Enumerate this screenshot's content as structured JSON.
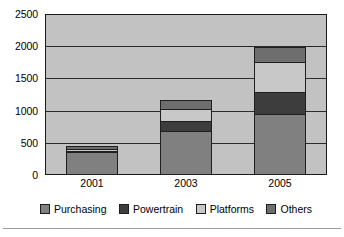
{
  "chart_data": {
    "type": "bar",
    "subtype": "stacked-bar",
    "title": "",
    "xlabel": "",
    "ylabel": "",
    "categories": [
      "2001",
      "2003",
      "2005"
    ],
    "ylim": [
      0,
      2500
    ],
    "yticks": [
      0,
      500,
      1000,
      1500,
      2000,
      2500
    ],
    "ytick_labels": [
      "0",
      "500",
      "1000",
      "1500",
      "2000",
      "2500"
    ],
    "grid": true,
    "grid_axis": "y",
    "legend_position": "bottom",
    "series": [
      {
        "name": "Purchasing",
        "color": "#808080",
        "values": [
          350,
          680,
          950
        ]
      },
      {
        "name": "Powertrain",
        "color": "#3d3d3d",
        "values": [
          40,
          170,
          360
        ]
      },
      {
        "name": "Platforms",
        "color": "#c8c8c8",
        "values": [
          40,
          200,
          470
        ]
      },
      {
        "name": "Others",
        "color": "#6e6e6e",
        "values": [
          70,
          160,
          250
        ]
      }
    ],
    "totals": [
      500,
      1210,
      2030
    ],
    "plot_background": "#c2c2c2",
    "axis_color": "#1a1a1a"
  },
  "legend": {
    "items": [
      {
        "label": "Purchasing",
        "swatch": "legend-swatch-purchasing"
      },
      {
        "label": "Powertrain",
        "swatch": "legend-swatch-powertrain"
      },
      {
        "label": "Platforms",
        "swatch": "legend-swatch-platforms"
      },
      {
        "label": "Others",
        "swatch": "legend-swatch-others"
      }
    ]
  }
}
